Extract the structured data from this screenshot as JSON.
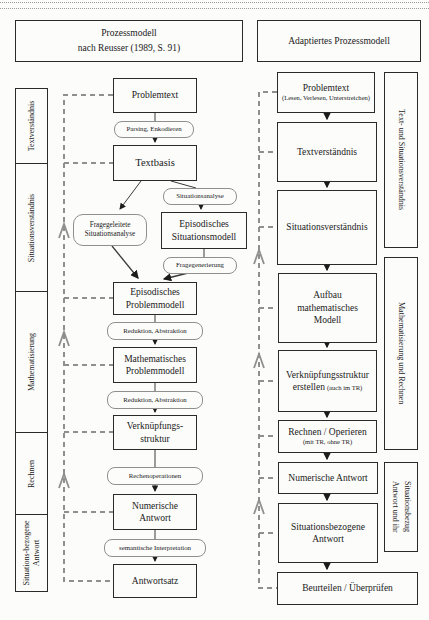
{
  "colors": {
    "box_border": "#2a2a2a",
    "dashed_feedback_line": "#8f8f8f",
    "background": "#fcfcfa"
  },
  "headers": {
    "left": {
      "line1": "Prozessmodell",
      "line2": "nach Reusser (1989, S. 91)"
    },
    "right": "Adaptiertes Prozessmodell"
  },
  "left_sidebar": {
    "phase1": "Textverständnis",
    "phase2": "Situationsverständnis",
    "phase3": "Mathematisierung",
    "phase4": "Rechnen",
    "phase5": "Situations-bezogene Antwort"
  },
  "reusser_model": {
    "problemtext": "Problemtext",
    "parsing": "Parsing, Enkodieren",
    "textbasis": "Textbasis",
    "situationsanalyse": "Situationsanalyse",
    "episodisches_situationsmodell": {
      "line1": "Episodisches",
      "line2": "Situationsmodell"
    },
    "fragegeleitete": {
      "line1": "Fragegeleitete",
      "line2": "Situationsanalyse"
    },
    "fragegenerierung": "Fragegenerierung",
    "episodisches_problemmodell": {
      "line1": "Episodisches",
      "line2": "Problemmodell"
    },
    "reduktion1": "Reduktion, Abstraktion",
    "mathematisches_problemmodell": {
      "line1": "Mathematisches",
      "line2": "Problemmodell"
    },
    "reduktion2": "Reduktion, Abstraktion",
    "verknuepfungsstruktur": {
      "line1": "Verknüpfungs-",
      "line2": "struktur"
    },
    "rechenoperationen": "Rechenoperationen",
    "numerische_antwort": {
      "line1": "Numerische",
      "line2": "Antwort"
    },
    "semantische_interpretation": "semantische Interpretation",
    "antwortsatz": "Antwortsatz"
  },
  "adapted_model": {
    "problemtext": {
      "title": "Problemtext",
      "subtitle": "(Lesen, Verlesen, Unterstreichen)"
    },
    "textverstaendnis": "Textverständnis",
    "situationsverstaendnis": "Situationsverständnis",
    "aufbau": {
      "line1": "Aufbau",
      "line2": "mathematisches",
      "line3": "Modell"
    },
    "verknuepfung": {
      "line1": "Verknüpfungsstruktur",
      "line2": "erstellen",
      "line2_note": "(auch im TR)"
    },
    "rechnen": {
      "title": "Rechnen / Operieren",
      "subtitle": "(mit TR, ohne TR)"
    },
    "numerische_antwort": "Numerische Antwort",
    "situationsbezogene_antwort": {
      "line1": "Situationsbezogene",
      "line2": "Antwort"
    },
    "beurteilen": "Beurteilen / Überprüfen"
  },
  "right_sidebar": {
    "phase1": "Text- und Situationsverständnis",
    "phase2": "Mathematisierung und Rechnen",
    "phase3": "Antwort und ihr Situationsbezug"
  }
}
